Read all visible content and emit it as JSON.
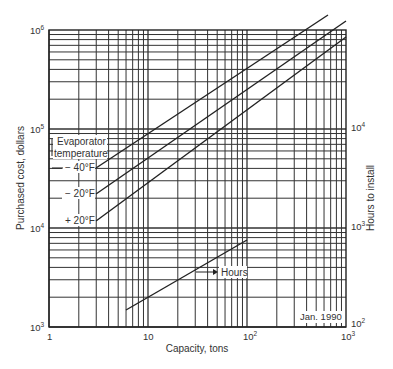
{
  "chart_data": {
    "type": "line",
    "title": "",
    "xlabel": "Capacity, tons",
    "ylabel": "Purchased cost, dollars",
    "y2label": "Hours to install",
    "xscale": "log",
    "yscale": "log",
    "xlim": [
      1,
      1000
    ],
    "ylim": [
      1000,
      1000000
    ],
    "y2lim": [
      100,
      100000
    ],
    "x_ticks": [
      "1",
      "10",
      "10²",
      "10³"
    ],
    "y_ticks": [
      "10³",
      "10⁴",
      "10⁵",
      "10⁶"
    ],
    "y2_ticks": [
      "10²",
      "10³",
      "10⁴"
    ],
    "grid": true,
    "annotations": [
      "Evaporator temperature",
      "Hours",
      "Jan. 1990"
    ],
    "series": [
      {
        "name": "−40°F",
        "axis": "cost",
        "x": [
          3,
          700
        ],
        "y": [
          40000,
          1400000
        ]
      },
      {
        "name": "−20°F",
        "axis": "cost",
        "x": [
          3,
          1000
        ],
        "y": [
          22000,
          900000
        ]
      },
      {
        "name": "+20°F",
        "axis": "cost",
        "x": [
          3,
          1000
        ],
        "y": [
          12000,
          700000
        ]
      },
      {
        "name": "Hours",
        "axis": "hours",
        "x": [
          6,
          90
        ],
        "y": [
          150,
          700
        ]
      }
    ]
  },
  "labels": {
    "evap_title_1": "Evaporator",
    "evap_title_2": "temperature",
    "t_minus40": "− 40°F",
    "t_minus20": "− 20°F",
    "t_plus20": "+ 20°F",
    "hours": "Hours",
    "date": "Jan. 1990",
    "xlabel": "Capacity, tons",
    "ylabel": "Purchased cost, dollars",
    "y2label": "Hours to install",
    "x_tick_1": "1",
    "x_tick_10": "10",
    "x_tick_100_base": "10",
    "x_tick_100_exp": "2",
    "x_tick_1000_base": "10",
    "x_tick_1000_exp": "3",
    "y_tick_3_base": "10",
    "y_tick_3_exp": "3",
    "y_tick_4_base": "10",
    "y_tick_4_exp": "4",
    "y_tick_5_base": "10",
    "y_tick_5_exp": "5",
    "y_tick_6_base": "10",
    "y_tick_6_exp": "6",
    "y2_tick_2_base": "10",
    "y2_tick_2_exp": "2",
    "y2_tick_3_base": "10",
    "y2_tick_3_exp": "3",
    "y2_tick_4_base": "10",
    "y2_tick_4_exp": "4"
  }
}
